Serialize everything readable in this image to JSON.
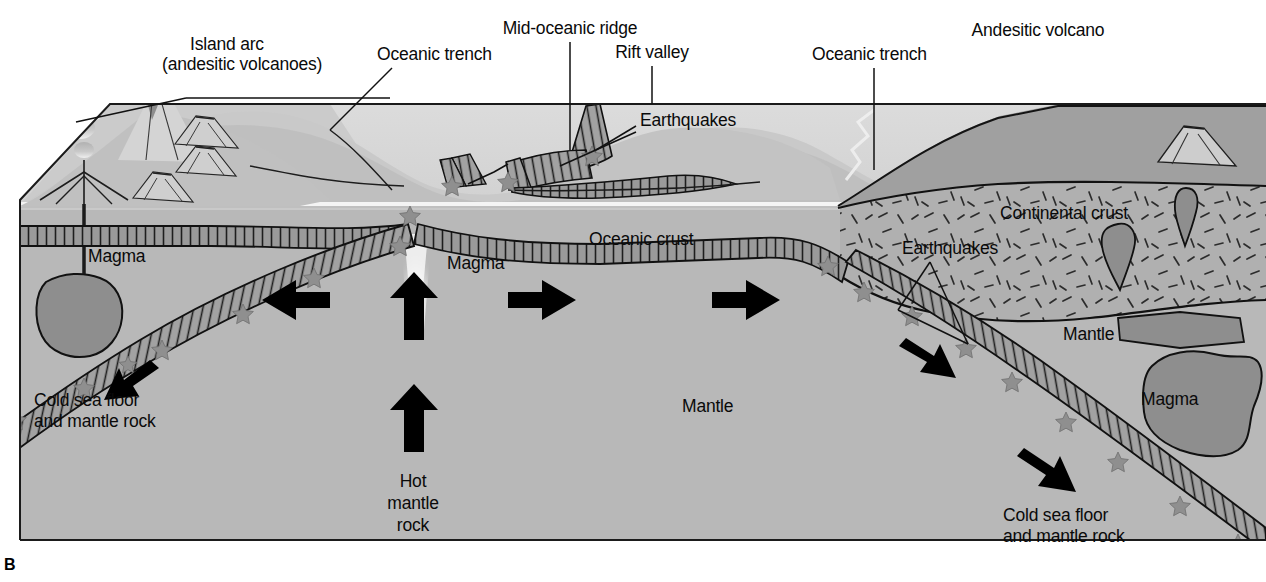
{
  "figure": {
    "panel_letter": "B",
    "frame": {
      "x": 20,
      "y": 92,
      "width": 1246,
      "height": 448
    }
  },
  "colors": {
    "sky": "#ffffff",
    "ocean_water": "#d9d9d9",
    "ocean_water_deep": "#cfcfcf",
    "seafloor_light": "#c6c6c6",
    "mantle": "#b8b8b8",
    "continental_crust": "#b0b0b0",
    "crust_band": "#9a9a9a",
    "slab_band": "#a2a2a2",
    "magma_blob": "#8e8e8e",
    "volcano_light": "#d2d2d2",
    "volcano_body": "#9d9d9d",
    "outline": "#141414",
    "earthquake_star": "#8a8a8a",
    "arrow": "#000000",
    "plume": "#f2f2f2",
    "text": "#0a0a0a"
  },
  "labels": [
    {
      "id": "island-arc",
      "text": "Island arc",
      "x": 190,
      "y": 44,
      "align": "left"
    },
    {
      "id": "island-arc-sub",
      "text": "(andesitic volcanoes)",
      "x": 162,
      "y": 64,
      "align": "left"
    },
    {
      "id": "oceanic-trench-l",
      "text": "Oceanic trench",
      "x": 377,
      "y": 54,
      "align": "left"
    },
    {
      "id": "mid-oceanic-ridge",
      "text": "Mid-oceanic ridge",
      "x": 570,
      "y": 28,
      "align": "center"
    },
    {
      "id": "rift-valley",
      "text": "Rift valley",
      "x": 652,
      "y": 52,
      "align": "center"
    },
    {
      "id": "earthquakes-ridge",
      "text": "Earthquakes",
      "x": 640,
      "y": 120,
      "align": "left"
    },
    {
      "id": "oceanic-trench-r",
      "text": "Oceanic trench",
      "x": 812,
      "y": 54,
      "align": "left"
    },
    {
      "id": "andesitic-volcano",
      "text": "Andesitic volcano",
      "x": 1038,
      "y": 30,
      "align": "center"
    },
    {
      "id": "continental-crust",
      "text": "Continental crust",
      "x": 1000,
      "y": 213,
      "align": "left"
    },
    {
      "id": "earthquakes-cont",
      "text": "Earthquakes",
      "x": 902,
      "y": 248,
      "align": "left"
    },
    {
      "id": "mantle-right",
      "text": "Mantle",
      "x": 1063,
      "y": 334,
      "align": "left"
    },
    {
      "id": "magma-right",
      "text": "Magma",
      "x": 1141,
      "y": 399,
      "align": "left"
    },
    {
      "id": "oceanic-crust",
      "text": "Oceanic crust",
      "x": 589,
      "y": 239,
      "align": "left"
    },
    {
      "id": "magma-left",
      "text": "Magma",
      "x": 88,
      "y": 256,
      "align": "left"
    },
    {
      "id": "magma-center",
      "text": "Magma",
      "x": 447,
      "y": 263,
      "align": "left"
    },
    {
      "id": "mantle-center",
      "text": "Mantle",
      "x": 682,
      "y": 406,
      "align": "left"
    },
    {
      "id": "cold-seafloor-l1",
      "text": "Cold sea floor",
      "x": 34,
      "y": 400,
      "align": "left"
    },
    {
      "id": "cold-seafloor-l2",
      "text": "and mantle rock",
      "x": 34,
      "y": 421,
      "align": "left"
    },
    {
      "id": "hot-mantle-1",
      "text": "Hot",
      "x": 413,
      "y": 481,
      "align": "center"
    },
    {
      "id": "hot-mantle-2",
      "text": "mantle",
      "x": 413,
      "y": 503,
      "align": "center"
    },
    {
      "id": "hot-mantle-3",
      "text": "rock",
      "x": 413,
      "y": 525,
      "align": "center"
    },
    {
      "id": "cold-seafloor-r1",
      "text": "Cold sea floor",
      "x": 1003,
      "y": 515,
      "align": "left"
    },
    {
      "id": "cold-seafloor-r2",
      "text": "and mantle rock",
      "x": 1003,
      "y": 536,
      "align": "left"
    }
  ],
  "features": {
    "volcanoes": [
      {
        "name": "island-arc-main-volcano",
        "plume": true
      },
      {
        "name": "island-arc-left-vent",
        "plume": true
      },
      {
        "name": "island-arc-small-cone-1",
        "plume": false
      },
      {
        "name": "island-arc-small-cone-2",
        "plume": false
      },
      {
        "name": "island-arc-small-cone-3",
        "plume": false
      },
      {
        "name": "andesitic-volcano-main",
        "plume": true
      },
      {
        "name": "andesitic-volcano-small",
        "plume": false
      }
    ],
    "motion_arrows": [
      {
        "name": "arrow-left-spread",
        "direction": "left"
      },
      {
        "name": "arrow-left-subduct",
        "direction": "down-left"
      },
      {
        "name": "arrow-right-spread-1",
        "direction": "right"
      },
      {
        "name": "arrow-right-spread-2",
        "direction": "right"
      },
      {
        "name": "arrow-right-spread-3",
        "direction": "right"
      },
      {
        "name": "arrow-right-subduct-1",
        "direction": "down-right"
      },
      {
        "name": "arrow-right-subduct-2",
        "direction": "down-right"
      },
      {
        "name": "arrow-upwelling-upper",
        "direction": "up"
      },
      {
        "name": "arrow-upwelling-lower",
        "direction": "up"
      }
    ],
    "earthquake_star_count": 22,
    "magma_chambers": [
      "magma-left-chamber",
      "magma-right-chamber",
      "magma-teardrop-1",
      "magma-teardrop-2",
      "magma-lens-1"
    ]
  }
}
